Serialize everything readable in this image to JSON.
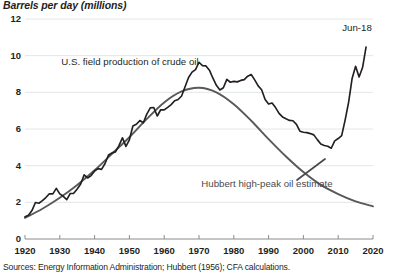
{
  "axis_title": "Barrels per day (millions)",
  "source_note": "Sources: Energy Information Administration; Hubbert (1956); CFA calculations.",
  "annotations": {
    "series_label": "U.S. field production of crude oil",
    "hubbert_label": "Hubbert high-peak oil estimate",
    "end_label": "Jun-18"
  },
  "colors": {
    "actual_line": "#231f20",
    "hubbert_line": "#595959",
    "gridline": "#e3e6e8",
    "axis": "#8c8c8c",
    "text": "#231f20"
  },
  "chart_data": {
    "type": "line",
    "title": "Barrels per day (millions)",
    "xlabel": "",
    "ylabel": "Barrels per day (millions)",
    "xlim": [
      1920,
      2020
    ],
    "ylim": [
      0,
      12
    ],
    "xticks": [
      1920,
      1930,
      1940,
      1950,
      1960,
      1970,
      1980,
      1990,
      2000,
      2010,
      2020
    ],
    "yticks": [
      0,
      2,
      4,
      6,
      8,
      10,
      12
    ],
    "grid": "horizontal",
    "legend": "annotations",
    "series": [
      {
        "name": "U.S. field production of crude oil",
        "x": [
          1920,
          1921,
          1922,
          1923,
          1924,
          1925,
          1926,
          1927,
          1928,
          1929,
          1930,
          1931,
          1932,
          1933,
          1934,
          1935,
          1936,
          1937,
          1938,
          1939,
          1940,
          1941,
          1942,
          1943,
          1944,
          1945,
          1946,
          1947,
          1948,
          1949,
          1950,
          1951,
          1952,
          1953,
          1954,
          1955,
          1956,
          1957,
          1958,
          1959,
          1960,
          1961,
          1962,
          1963,
          1964,
          1965,
          1966,
          1967,
          1968,
          1969,
          1970,
          1971,
          1972,
          1973,
          1974,
          1975,
          1976,
          1977,
          1978,
          1979,
          1980,
          1981,
          1982,
          1983,
          1984,
          1985,
          1986,
          1987,
          1988,
          1989,
          1990,
          1991,
          1992,
          1993,
          1994,
          1995,
          1996,
          1997,
          1998,
          1999,
          2000,
          2001,
          2002,
          2003,
          2004,
          2005,
          2006,
          2007,
          2008,
          2009,
          2010,
          2011,
          2012,
          2013,
          2014,
          2015,
          2016,
          2017,
          2018
        ],
        "y": [
          1.21,
          1.29,
          1.55,
          1.99,
          1.95,
          2.09,
          2.26,
          2.47,
          2.46,
          2.76,
          2.46,
          2.33,
          2.15,
          2.48,
          2.49,
          2.73,
          3.0,
          3.5,
          3.33,
          3.46,
          3.71,
          3.84,
          3.8,
          4.12,
          4.58,
          4.7,
          4.75,
          5.09,
          5.52,
          5.05,
          5.41,
          6.16,
          6.26,
          6.46,
          6.34,
          6.81,
          7.15,
          7.17,
          6.71,
          7.05,
          7.04,
          7.18,
          7.33,
          7.54,
          7.61,
          7.8,
          8.3,
          8.81,
          9.1,
          9.24,
          9.64,
          9.46,
          9.44,
          9.21,
          8.77,
          8.38,
          8.13,
          8.25,
          8.71,
          8.55,
          8.6,
          8.57,
          8.65,
          8.69,
          8.88,
          8.97,
          8.68,
          8.35,
          8.14,
          7.61,
          7.36,
          7.42,
          7.17,
          6.85,
          6.66,
          6.56,
          6.47,
          6.45,
          6.25,
          5.88,
          5.82,
          5.8,
          5.75,
          5.68,
          5.42,
          5.18,
          5.1,
          5.06,
          4.95,
          5.35,
          5.48,
          5.64,
          6.5,
          7.47,
          8.76,
          9.42,
          8.84,
          9.35,
          10.47
        ],
        "end_value": 10.47,
        "end_label": "Jun-18",
        "peak_value": 9.64,
        "peak_year": 1970
      },
      {
        "name": "Hubbert high-peak oil estimate",
        "x": [
          1920,
          1925,
          1930,
          1935,
          1940,
          1945,
          1950,
          1955,
          1960,
          1965,
          1970,
          1975,
          1980,
          1985,
          1990,
          1995,
          2000,
          2005,
          2010,
          2015,
          2020
        ],
        "y": [
          1.15,
          1.65,
          2.25,
          2.95,
          3.75,
          4.65,
          5.55,
          6.55,
          7.45,
          8.05,
          8.25,
          8.0,
          7.35,
          6.45,
          5.45,
          4.5,
          3.65,
          2.95,
          2.45,
          2.05,
          1.78
        ],
        "peak_value": 8.25,
        "peak_year": 1970
      }
    ]
  }
}
